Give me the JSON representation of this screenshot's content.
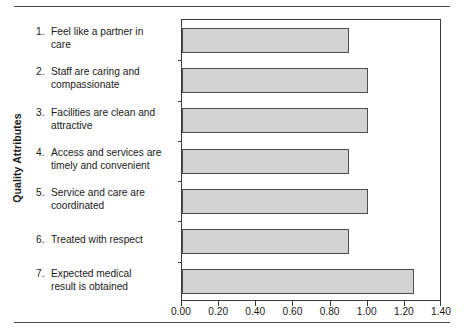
{
  "chart_data": {
    "type": "bar",
    "orientation": "horizontal",
    "title": "",
    "xlabel": "",
    "ylabel": "Quality Attributes",
    "xlim": [
      0.0,
      1.4
    ],
    "xticks": [
      "0.00",
      "0.20",
      "0.40",
      "0.60",
      "0.80",
      "1.00",
      "1.20",
      "1.40"
    ],
    "xtick_values": [
      0.0,
      0.2,
      0.4,
      0.6,
      0.8,
      1.0,
      1.2,
      1.4
    ],
    "grid": false,
    "legend": null,
    "categories": [
      "Feel like a partner in care",
      "Staff are caring and compassionate",
      "Facilities are clean and attractive",
      "Access and services are timely and convenient",
      "Service and care are coordinated",
      "Treated with respect",
      "Expected medical result is obtained"
    ],
    "category_numbers": [
      "1.",
      "2.",
      "3.",
      "4.",
      "5.",
      "6.",
      "7."
    ],
    "category_lines": [
      [
        "Feel like a partner in",
        "care"
      ],
      [
        "Staff are caring and",
        "compassionate"
      ],
      [
        "Facilities are clean and",
        "attractive"
      ],
      [
        "Access and services are",
        "timely and convenient"
      ],
      [
        "Service and care are",
        "coordinated"
      ],
      [
        "Treated with respect",
        ""
      ],
      [
        "Expected medical",
        "result is obtained"
      ]
    ],
    "values": [
      0.9,
      1.0,
      1.0,
      0.9,
      1.0,
      0.9,
      1.25
    ],
    "bar_fill": "#d3d3d3",
    "bar_border": "#4d4d4d",
    "axis_color": "#3b3b3b"
  }
}
